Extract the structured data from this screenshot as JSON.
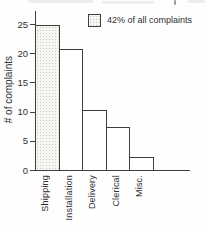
{
  "chart_data": {
    "type": "bar",
    "title": "",
    "categories": [
      "Shipping",
      "Installation",
      "Delivery",
      "Clerical",
      "Misc."
    ],
    "values": [
      24.8,
      20.8,
      10.3,
      7.4,
      2.2
    ],
    "xlabel": "",
    "ylabel": "# of complaints",
    "ylim": [
      0,
      25
    ],
    "yticks": [
      0,
      5,
      10,
      15,
      20,
      25
    ],
    "grid": false,
    "legend": {
      "label": "42% of all complaints",
      "position": "top-right",
      "swatch_style": "stippled-light",
      "refers_to": "Shipping"
    },
    "highlighted_category": "Shipping",
    "colors": {
      "bar_fill_default": "#ffffff",
      "bar_fill_highlight": "#f7f6f2",
      "line": "#3f3f3f",
      "text": "#2f2f2f"
    }
  }
}
